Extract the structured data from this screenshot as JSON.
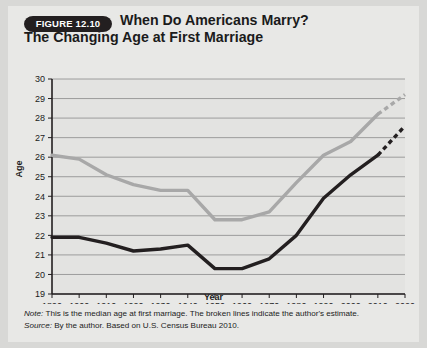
{
  "figure": {
    "badge": "FIGURE 12.10",
    "title_line1": "When Do Americans Marry?",
    "title_line2": "The Changing Age at First Marriage",
    "note_label": "Note:",
    "note_text": " This is the median age at first marriage. The broken lines indicate the author's estimate.",
    "source_label": "Source:",
    "source_text": " By the author. Based on U.S. Census Bureau 2010."
  },
  "colors": {
    "men_line": "#a8a8a8",
    "women_line": "#231f20",
    "grid": "#8a8a8a",
    "axis": "#231f20",
    "plot_background": "#e3e3e1",
    "card_background": "#e8e8e6",
    "page_background": "#d8d8d6",
    "badge_background": "#231f20",
    "text": "#1b1b1b"
  },
  "chart_data": {
    "type": "line",
    "title": "When Do Americans Marry? The Changing Age at First Marriage",
    "xlabel": "Year",
    "ylabel": "Age",
    "xlim": [
      1890,
      2020
    ],
    "ylim": [
      19,
      30
    ],
    "ytick_step": 1,
    "xtick_step": 10,
    "grid": true,
    "legend": "inline-labels",
    "x": [
      1890,
      1900,
      1910,
      1920,
      1930,
      1940,
      1950,
      1960,
      1970,
      1980,
      1990,
      2000,
      2010,
      2020
    ],
    "yticks": [
      19,
      20,
      21,
      22,
      23,
      24,
      25,
      26,
      27,
      28,
      29,
      30
    ],
    "xticks": [
      "1890",
      "1900",
      "1910",
      "1920",
      "1930",
      "1940",
      "1950",
      "1960",
      "1970",
      "1980",
      "1990",
      "2000",
      "2010",
      "2020"
    ],
    "series": [
      {
        "name": "Men",
        "color": "#a8a8a8",
        "values": [
          26.1,
          25.9,
          25.1,
          24.6,
          24.3,
          24.3,
          22.8,
          22.8,
          23.2,
          24.7,
          26.1,
          26.8,
          28.2,
          29.2
        ],
        "solid_until": 2010,
        "dashed_from": 2010,
        "dashed_note": "author's estimate"
      },
      {
        "name": "Women",
        "color": "#231f20",
        "values": [
          21.9,
          21.9,
          21.6,
          21.2,
          21.3,
          21.5,
          20.3,
          20.3,
          20.8,
          22.0,
          23.9,
          25.1,
          26.1,
          27.6
        ],
        "solid_until": 2010,
        "dashed_from": 2010,
        "dashed_note": "author's estimate"
      }
    ]
  }
}
